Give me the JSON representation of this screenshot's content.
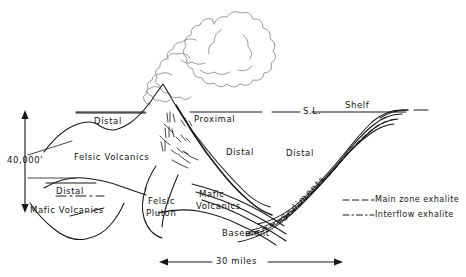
{
  "figure": {
    "type": "geologic-cross-section"
  },
  "labels": {
    "sea_level": "S.L.",
    "shelf": "Shelf",
    "distal_left_upper": "Distal",
    "distal_left_lower": "Distal",
    "distal_center": "Distal",
    "distal_right": "Distal",
    "proximal": "Proximal",
    "felsic_volcanics": "Felsic Volcanics",
    "mafic_volcanics_left": "Mafic Volcanics",
    "mafic_volcanics_center": "Mafic\nVolcanics",
    "mafic_volcanics_center_line1": "Mafic",
    "mafic_volcanics_center_line2": "Volcanics",
    "felsic_pluton_line1": "Felsic",
    "felsic_pluton_line2": "Pluton",
    "basement": "Basement",
    "sediments": "Sediments"
  },
  "scales": {
    "vertical_value": "40,000'",
    "horizontal_value": "30 miles"
  },
  "legend": {
    "items": [
      {
        "key": "main-zone-exhalite",
        "label": "Main zone exhalite",
        "line_style": "dashed"
      },
      {
        "key": "interflow-exhalite",
        "label": "Interflow exhalite",
        "line_style": "dash-dot"
      }
    ]
  },
  "colors": {
    "ink": "#161616",
    "cloud": "#8a8a8a",
    "background": "#ffffff"
  }
}
